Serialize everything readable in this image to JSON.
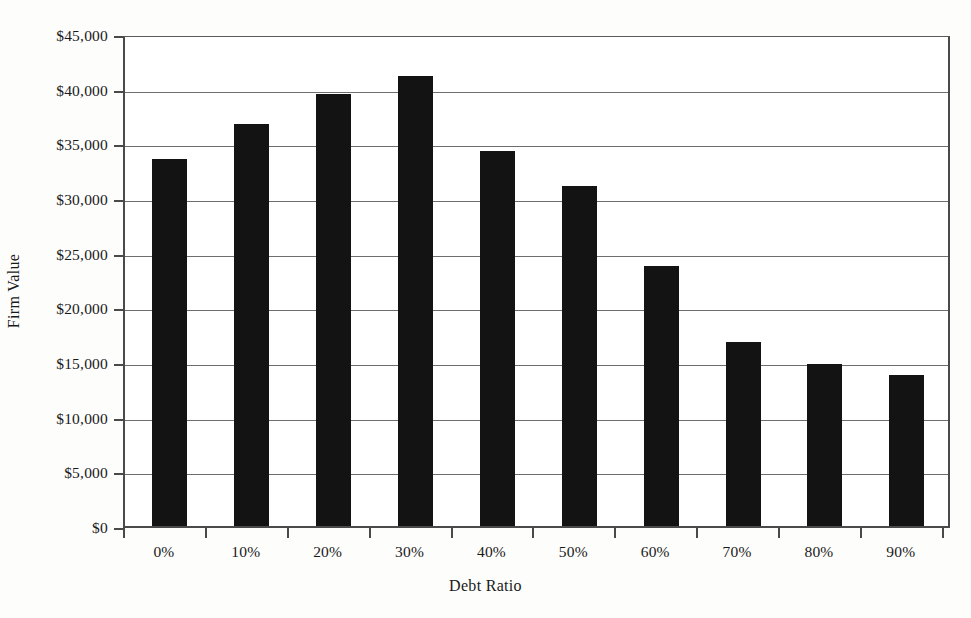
{
  "chart_data": {
    "type": "bar",
    "title": "",
    "subtitle": "",
    "xlabel": "Debt Ratio",
    "ylabel": "Firm Value",
    "categories": [
      "0%",
      "10%",
      "20%",
      "30%",
      "40%",
      "50%",
      "60%",
      "70%",
      "80%",
      "90%"
    ],
    "values": [
      33570,
      36770,
      39510,
      41160,
      34300,
      31060,
      23800,
      16800,
      14820,
      13800
    ],
    "ylim": [
      0,
      45000
    ],
    "ytick_values": [
      0,
      5000,
      10000,
      15000,
      20000,
      25000,
      30000,
      35000,
      40000,
      45000
    ],
    "ytick_labels": [
      "$0",
      "$5,000",
      "$10,000",
      "$15,000",
      "$20,000",
      "$25,000",
      "$30,000",
      "$35,000",
      "$40,000",
      "$45,000"
    ],
    "grid": true,
    "grid_axis": "y",
    "legend": false,
    "legend_position": "none",
    "bar_color": "#131313",
    "grid_color": "#6e6e6e",
    "axis_color": "#4a4a4a",
    "background_color": "#ffffff"
  }
}
